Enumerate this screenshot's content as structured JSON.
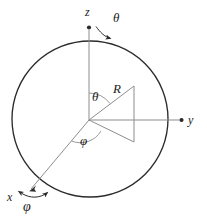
{
  "figure": {
    "type": "spherical-coordinate-diagram",
    "width": 207,
    "height": 219,
    "background_color": "#ffffff",
    "line_color": "#2b2b2b",
    "thin_line_color": "#8d8d8d",
    "sphere": {
      "center_x": 90,
      "center_y": 119,
      "radius": 78,
      "stroke_width": 1.3
    },
    "origin": {
      "x": 89,
      "y": 120
    }
  },
  "labels": {
    "z_axis": "z",
    "y_axis": "y",
    "x_axis": "x",
    "radius": "R",
    "theta_top": "θ",
    "theta_inner": "θ",
    "phi_inner": "φ",
    "phi_bottom": "φ"
  },
  "axes": [
    {
      "name": "z-axis",
      "label": "z",
      "from": {
        "x": 89,
        "y": 120
      },
      "to": {
        "x": 89,
        "y": 26
      },
      "arrow": "up"
    },
    {
      "name": "y-axis",
      "label": "y",
      "from": {
        "x": 89,
        "y": 120
      },
      "to": {
        "x": 184,
        "y": 120
      },
      "arrow": "right"
    },
    {
      "name": "x-axis",
      "label": "x",
      "from": {
        "x": 89,
        "y": 120
      },
      "to": {
        "x": 29,
        "y": 191
      },
      "arrow": "down-left"
    }
  ],
  "cone": {
    "apex": {
      "x": 89,
      "y": 120
    },
    "upper_edge_to": {
      "x": 134,
      "y": 86
    },
    "lower_edge_to": {
      "x": 134,
      "y": 142
    },
    "base_line": {
      "x": 134,
      "y1": 86,
      "y2": 142
    }
  },
  "annotations": {
    "theta_arc": "arc between z-axis and R vector",
    "phi_arc": "arc in xy-plane between x-axis and cone lower edge",
    "theta_curved_arrow": "curved arrow indicating theta sweep from z-axis",
    "phi_curved_arrow": "double-headed curved arrow indicating phi sweep at x-axis"
  },
  "colors": {
    "ink": "#2b2b2b",
    "light_ink": "#8d8d8d",
    "paper": "#ffffff"
  }
}
